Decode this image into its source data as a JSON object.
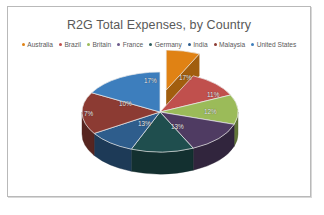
{
  "chart": {
    "title": "R2G Total Expenses, by Country",
    "legend_position": "top"
  },
  "chart_data": {
    "type": "pie",
    "title": "R2G Total Expenses, by Country",
    "xlabel": "",
    "ylabel": "",
    "style": "3d-exploded-pie",
    "exploded_slice": "Australia",
    "categories": [
      "Australia",
      "Brazil",
      "Britain",
      "France",
      "Germany",
      "India",
      "Malaysia",
      "United States"
    ],
    "values": [
      7,
      11,
      12,
      13,
      13,
      10,
      17,
      17
    ],
    "labels": [
      "7%",
      "11%",
      "12%",
      "13%",
      "13%",
      "10%",
      "17%",
      "17%"
    ],
    "colors": [
      "#e08214",
      "#c0504d",
      "#9bbb59",
      "#4f3b62",
      "#1f4e4e",
      "#2e5d8c",
      "#8c3b33",
      "#3d7ebd"
    ],
    "legend": [
      {
        "label": "Australia",
        "color": "#e08214"
      },
      {
        "label": "Brazil",
        "color": "#c0504d"
      },
      {
        "label": "Britain",
        "color": "#9bbb59"
      },
      {
        "label": "France",
        "color": "#6b5a8a"
      },
      {
        "label": "Germany",
        "color": "#2f5d5d"
      },
      {
        "label": "India",
        "color": "#2e5d8c"
      },
      {
        "label": "Malaysia",
        "color": "#8c3b33"
      },
      {
        "label": "United States",
        "color": "#3d7ebd"
      }
    ],
    "slice_labels": [
      {
        "name": "united-states",
        "text": "17%",
        "x": 171,
        "y": 24
      },
      {
        "name": "brazil",
        "text": "11%",
        "x": 199,
        "y": 41
      },
      {
        "name": "britain",
        "text": "12%",
        "x": 196,
        "y": 58
      },
      {
        "name": "france",
        "text": "13%",
        "x": 163,
        "y": 73
      },
      {
        "name": "germany",
        "text": "13%",
        "x": 130,
        "y": 70
      },
      {
        "name": "australia",
        "text": "7%",
        "x": 76,
        "y": 60
      },
      {
        "name": "india",
        "text": "10%",
        "x": 111,
        "y": 50
      },
      {
        "name": "malaysia",
        "text": "17%",
        "x": 136,
        "y": 27
      }
    ]
  }
}
